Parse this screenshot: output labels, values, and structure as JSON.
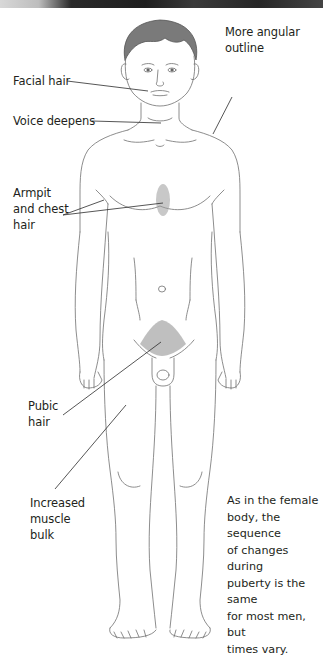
{
  "diagram": {
    "labels": [
      {
        "id": "facial-hair",
        "text": "Facial hair"
      },
      {
        "id": "voice-deepens",
        "text": "Voice deepens"
      },
      {
        "id": "more-angular-outline",
        "text": "More angular\noutline"
      },
      {
        "id": "armpit-chest-hair",
        "text": "Armpit\nand chest\nhair"
      },
      {
        "id": "pubic-hair",
        "text": "Pubic\nhair"
      },
      {
        "id": "increased-muscle-bulk",
        "text": "Increased\nmuscle\nbulk"
      }
    ],
    "note": "As in the female\nbody, the sequence\nof changes during\npuberty is the same\nfor most men, but\ntimes vary."
  },
  "colors": {
    "background": "#ffffff",
    "outline": "#6b6b6b",
    "leader_line": "#2b2b2b",
    "hair": "#6a6a6a",
    "text": "#231f20"
  }
}
